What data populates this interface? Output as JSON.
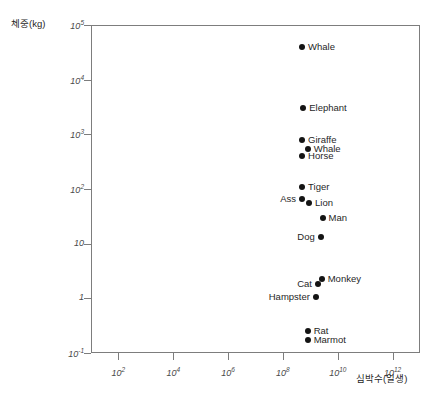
{
  "chart_data": {
    "type": "scatter",
    "title": "",
    "panel_label": "B",
    "xlabel": "심박수(일생)",
    "ylabel": "체중(kg)",
    "xscale": "log",
    "yscale": "log",
    "grid": false,
    "legend": "none",
    "xlim": [
      10.0,
      10000000000000.0
    ],
    "ylim": [
      0.1,
      100000.0
    ],
    "xticks": [
      {
        "value": 100,
        "label": "10",
        "exponent": "2"
      },
      {
        "value": 10000,
        "label": "10",
        "exponent": "4"
      },
      {
        "value": 1000000,
        "label": "10",
        "exponent": "6"
      },
      {
        "value": 100000000,
        "label": "10",
        "exponent": "8"
      },
      {
        "value": 10000000000,
        "label": "10",
        "exponent": "10"
      },
      {
        "value": 1000000000000,
        "label": "10",
        "exponent": "12"
      }
    ],
    "yticks": [
      {
        "value": 100000,
        "label": "10",
        "exponent": "5"
      },
      {
        "value": 10000,
        "label": "10",
        "exponent": "4"
      },
      {
        "value": 1000,
        "label": "10",
        "exponent": "3"
      },
      {
        "value": 100,
        "label": "10",
        "exponent": "2"
      },
      {
        "value": 10,
        "label": "10",
        "exponent": ""
      },
      {
        "value": 1,
        "label": "1",
        "exponent": ""
      },
      {
        "value": 0.1,
        "label": "10",
        "exponent": "-1"
      }
    ],
    "points": [
      {
        "name": "Whale",
        "x": 500000000.0,
        "y": 40000.0,
        "label_side": "right"
      },
      {
        "name": "Elephant",
        "x": 550000000.0,
        "y": 3000.0,
        "label_side": "right"
      },
      {
        "name": "Giraffe",
        "x": 500000000.0,
        "y": 800.0,
        "label_side": "right"
      },
      {
        "name": "Whale",
        "x": 800000000.0,
        "y": 550.0,
        "label_side": "right"
      },
      {
        "name": "Horse",
        "x": 500000000.0,
        "y": 400.0,
        "label_side": "right"
      },
      {
        "name": "Tiger",
        "x": 500000000.0,
        "y": 110.0,
        "label_side": "right"
      },
      {
        "name": "Ass",
        "x": 500000000.0,
        "y": 65.0,
        "label_side": "left"
      },
      {
        "name": "Lion",
        "x": 900000000.0,
        "y": 55.0,
        "label_side": "right"
      },
      {
        "name": "Man",
        "x": 2800000000.0,
        "y": 30.0,
        "label_side": "right"
      },
      {
        "name": "Dog",
        "x": 2400000000.0,
        "y": 13.0,
        "label_side": "left"
      },
      {
        "name": "Monkey",
        "x": 2600000000.0,
        "y": 2.3,
        "label_side": "right"
      },
      {
        "name": "Cat",
        "x": 1900000000.0,
        "y": 1.8,
        "label_side": "left"
      },
      {
        "name": "Hampster",
        "x": 1600000000.0,
        "y": 1.05,
        "label_side": "left"
      },
      {
        "name": "Rat",
        "x": 800000000.0,
        "y": 0.25,
        "label_side": "right"
      },
      {
        "name": "Marmot",
        "x": 800000000.0,
        "y": 0.17,
        "label_side": "right"
      }
    ]
  }
}
